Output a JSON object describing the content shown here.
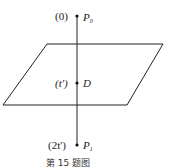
{
  "diagram": {
    "points": [
      {
        "id": "P0",
        "name": "P",
        "subscript": "0",
        "param": "(0)"
      },
      {
        "id": "D",
        "name": "D",
        "param": "(t')"
      },
      {
        "id": "P1",
        "name": "P",
        "subscript": "1",
        "param": "(2t')"
      }
    ],
    "plane": "parallelogram",
    "caption": "第 15 题图",
    "stroke_color": "#222222"
  }
}
